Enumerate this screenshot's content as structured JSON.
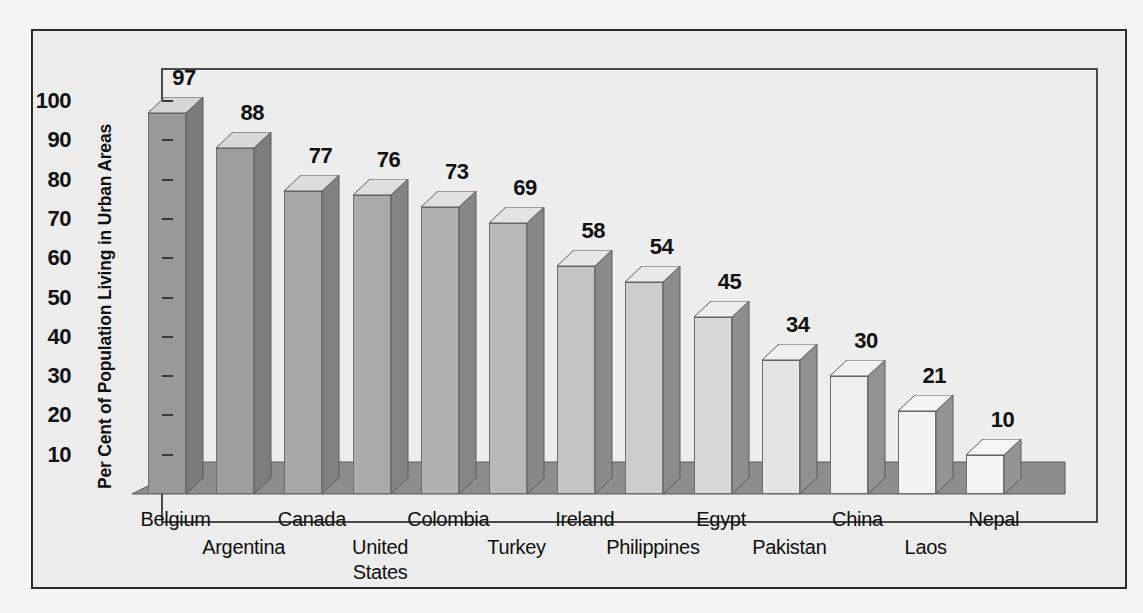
{
  "chart_data": {
    "type": "bar",
    "title": "",
    "xlabel": "",
    "ylabel": "Per Cent of Population Living in Urban Areas",
    "ylim": [
      0,
      105
    ],
    "yticks": [
      10,
      20,
      30,
      40,
      50,
      60,
      70,
      80,
      90,
      100
    ],
    "grid": false,
    "legend": "none",
    "style": "3d-bar",
    "categories": [
      "Belgium",
      "Argentina",
      "Canada",
      "United States",
      "Colombia",
      "Turkey",
      "Ireland",
      "Philippines",
      "Egypt",
      "Pakistan",
      "China",
      "Laos",
      "Nepal"
    ],
    "values": [
      97,
      88,
      77,
      76,
      73,
      69,
      58,
      54,
      45,
      34,
      30,
      21,
      10
    ],
    "value_labels": [
      "97",
      "88",
      "77",
      "76",
      "73",
      "69",
      "58",
      "54",
      "45",
      "34",
      "30",
      "21",
      "10"
    ],
    "bar_face_colors": [
      "#999999",
      "#9e9e9e",
      "#a8a8a8",
      "#ababab",
      "#b0b0b0",
      "#b8b8b8",
      "#c4c4c4",
      "#cdcdcd",
      "#d8d8d8",
      "#e4e4e4",
      "#efefef",
      "#f2f2f2",
      "#f4f4f4"
    ],
    "bar_side_colors": [
      "#7b7b7b",
      "#7d7d7d",
      "#828282",
      "#848484",
      "#868686",
      "#888888",
      "#8a8a8a",
      "#8c8c8c",
      "#8e8e8e",
      "#909090",
      "#929292",
      "#949494",
      "#949494"
    ],
    "bar_top_colors": [
      "#d5d5d5",
      "#d8d8d8",
      "#dcdcdc",
      "#dedede",
      "#e0e0e0",
      "#e3e3e3",
      "#e6e6e6",
      "#e9e9e9",
      "#ececec",
      "#efefef",
      "#f2f2f2",
      "#f4f4f4",
      "#f5f5f5"
    ]
  },
  "axis": {
    "y_title": "Per Cent of Population Living in Urban Areas",
    "y_tick_labels": [
      "100",
      "90",
      "80",
      "70",
      "60",
      "50",
      "40",
      "30",
      "20",
      "10"
    ]
  },
  "colors": {
    "background": "#ececec",
    "plot_background": "#ededed",
    "frame": "#2b2b2b",
    "plot_frame": "#4a4a4a",
    "floor_top": "#8d8d8d",
    "floor_front": "#707070",
    "text": "#111111"
  }
}
